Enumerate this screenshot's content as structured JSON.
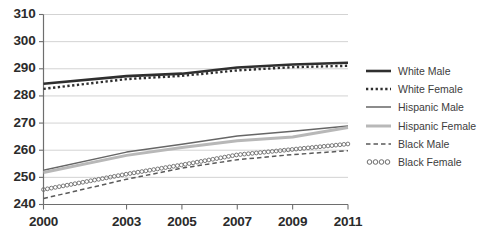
{
  "chart_data": {
    "type": "line",
    "title": "",
    "subtitle": "",
    "xlabel": "",
    "ylabel": "",
    "x": [
      2000,
      2003,
      2005,
      2007,
      2009,
      2011
    ],
    "xtick_labels": [
      "2000",
      "2003",
      "2005",
      "2007",
      "2009",
      "2011"
    ],
    "ytick_labels": [
      "240",
      "250",
      "260",
      "270",
      "280",
      "290",
      "300",
      "310"
    ],
    "ylim": [
      240,
      310
    ],
    "xlim": [
      2000,
      2011
    ],
    "ytick_step": 10,
    "grid": "horizontal",
    "legend_position": "right",
    "series": [
      {
        "name": "White Male",
        "style": "solid-thick",
        "color": "#2f2f2f",
        "width": 2.6,
        "values": [
          284.5,
          287.3,
          288.2,
          290.5,
          291.6,
          292.2
        ]
      },
      {
        "name": "White Female",
        "style": "dotted",
        "color": "#2f2f2f",
        "width": 2.4,
        "values": [
          282.6,
          286.2,
          287.4,
          289.4,
          290.6,
          291.1
        ]
      },
      {
        "name": "Hispanic Male",
        "style": "solid",
        "color": "#666666",
        "width": 1.5,
        "values": [
          252.6,
          259.3,
          262.2,
          265.2,
          267.0,
          268.9
        ]
      },
      {
        "name": "Hispanic Female",
        "style": "solid-thick-light",
        "color": "#b8b8b8",
        "width": 3.0,
        "values": [
          251.8,
          258.1,
          261.0,
          263.5,
          264.9,
          268.4
        ]
      },
      {
        "name": "Black Male",
        "style": "dashed",
        "color": "#5a5a5a",
        "width": 1.5,
        "values": [
          242.2,
          249.3,
          253.4,
          256.5,
          258.4,
          259.8
        ]
      },
      {
        "name": "Black Female",
        "style": "circles",
        "color": "#6b6b6b",
        "width": 1.2,
        "values": [
          245.5,
          251.2,
          254.6,
          258.3,
          260.3,
          262.3
        ]
      }
    ]
  },
  "legend": {
    "items": [
      {
        "label": "White Male"
      },
      {
        "label": "White Female"
      },
      {
        "label": "Hispanic Male"
      },
      {
        "label": "Hispanic Female"
      },
      {
        "label": "Black Male"
      },
      {
        "label": "Black Female"
      }
    ]
  },
  "colors": {
    "axis": "#6e6e6e",
    "grid": "#d3d3d3",
    "text": "#2b2b2b",
    "legend_text": "#3d3d3d",
    "background": "#ffffff"
  }
}
